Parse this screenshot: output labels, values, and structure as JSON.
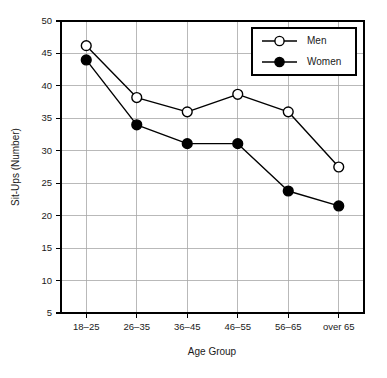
{
  "chart_data": {
    "type": "line",
    "title": "",
    "xlabel": "Age Group",
    "ylabel": "Sit-Ups (Number)",
    "categories": [
      "18–25",
      "26–35",
      "36–45",
      "46–55",
      "56–65",
      "over 65"
    ],
    "ylim": [
      5,
      50
    ],
    "ytick_labels": [
      "5",
      "10",
      "15",
      "20",
      "25",
      "30",
      "35",
      "40",
      "45",
      "50"
    ],
    "yticks": [
      5,
      10,
      15,
      20,
      25,
      30,
      35,
      40,
      45,
      50
    ],
    "grid": true,
    "grid_axis": "both",
    "legend_position": "upper-right",
    "series": [
      {
        "name": "Men",
        "marker": "open-circle",
        "color": "#000000",
        "values": [
          46.2,
          38.2,
          36.0,
          38.7,
          36.0,
          27.5
        ]
      },
      {
        "name": "Women",
        "marker": "filled-circle",
        "color": "#000000",
        "values": [
          44.0,
          34.0,
          31.1,
          31.1,
          23.8,
          21.5
        ]
      }
    ]
  },
  "legend": {
    "entries": [
      {
        "label": "Men"
      },
      {
        "label": "Women"
      }
    ]
  },
  "axes": {
    "x_title": "Age Group",
    "y_title": "Sit-Ups (Number)"
  }
}
